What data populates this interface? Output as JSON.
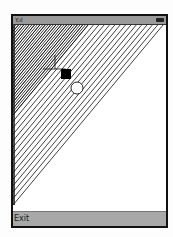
{
  "status_bar": {
    "signal_icon": "signal-antenna-icon",
    "battery_icon": "battery-icon",
    "signal_text": "Y.ıl"
  },
  "canvas": {
    "pattern": "string-art-curve",
    "line_count": 28,
    "stroke": "#111111",
    "marker_square": {
      "x": 53,
      "y": 62,
      "size": 10,
      "fill": "#000000"
    },
    "marker_circle": {
      "cx": 64,
      "cy": 80,
      "r": 6
    },
    "crosshair": {
      "x": 42,
      "y": 44
    }
  },
  "softkeys": {
    "left_label": "Exit"
  }
}
